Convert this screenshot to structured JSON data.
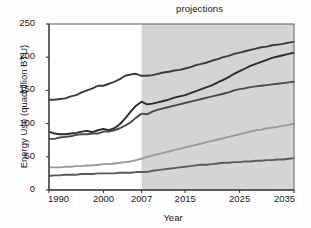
{
  "chart_data": {
    "type": "line",
    "title": "projections",
    "xlabel": "Year",
    "ylabel": "Energy Use (quadrillion BTU)",
    "xlim": [
      1990,
      2035
    ],
    "ylim": [
      0,
      250
    ],
    "xticks": [
      "1990",
      "2000",
      "2007",
      "2015",
      "2025",
      "2035"
    ],
    "xtick_values": [
      1990,
      2000,
      2007,
      2015,
      2025,
      2035
    ],
    "yticks": [
      "0",
      "50",
      "100",
      "150",
      "200",
      "250"
    ],
    "ytick_values": [
      0,
      50,
      100,
      150,
      200,
      250
    ],
    "grid": false,
    "legend_position": "inline-right",
    "annotations": [
      {
        "text": "projections",
        "note": "label above shaded forecast region beginning at 2007"
      }
    ],
    "shaded_region": {
      "from": 2007,
      "to": 2035,
      "label": "projections",
      "color": "#cccccc"
    },
    "x": [
      1990,
      1991,
      1992,
      1993,
      1994,
      1995,
      1996,
      1997,
      1998,
      1999,
      2000,
      2001,
      2002,
      2003,
      2004,
      2005,
      2006,
      2007,
      2008,
      2009,
      2010,
      2011,
      2012,
      2013,
      2014,
      2015,
      2016,
      2017,
      2018,
      2019,
      2020,
      2021,
      2022,
      2023,
      2024,
      2025,
      2026,
      2027,
      2028,
      2029,
      2030,
      2031,
      2032,
      2033,
      2034,
      2035
    ],
    "series": [
      {
        "name": "liquids",
        "color": "#3a3a3a",
        "values": [
          136,
          136,
          137,
          138,
          141,
          143,
          147,
          150,
          153,
          157,
          157,
          160,
          163,
          167,
          172,
          174,
          175,
          172,
          172,
          173,
          175,
          177,
          178,
          180,
          181,
          183,
          185,
          188,
          190,
          192,
          195,
          197,
          200,
          202,
          205,
          207,
          209,
          211,
          213,
          215,
          216,
          218,
          219,
          220,
          222,
          223
        ]
      },
      {
        "name": "coal",
        "color": "#2a2a2a",
        "values": [
          88,
          85,
          84,
          84,
          85,
          86,
          88,
          89,
          87,
          90,
          92,
          90,
          93,
          99,
          108,
          118,
          127,
          133,
          129,
          130,
          132,
          134,
          136,
          139,
          141,
          143,
          146,
          149,
          152,
          155,
          158,
          162,
          166,
          170,
          175,
          179,
          183,
          187,
          190,
          193,
          196,
          199,
          201,
          203,
          205,
          207
        ]
      },
      {
        "name": "natural gas",
        "color": "#4a4a4a",
        "values": [
          77,
          77,
          79,
          80,
          81,
          83,
          84,
          84,
          85,
          85,
          88,
          88,
          90,
          93,
          97,
          102,
          109,
          115,
          114,
          118,
          121,
          123,
          125,
          127,
          129,
          131,
          133,
          135,
          137,
          139,
          141,
          143,
          145,
          147,
          150,
          152,
          153,
          155,
          156,
          157,
          158,
          159,
          160,
          161,
          162,
          163
        ]
      },
      {
        "name": "renewables",
        "color": "#9a9a9a",
        "values": [
          34,
          34,
          34,
          35,
          35,
          36,
          36,
          37,
          37,
          38,
          39,
          39,
          40,
          41,
          42,
          43,
          45,
          47,
          50,
          52,
          54,
          56,
          58,
          60,
          62,
          64,
          66,
          68,
          70,
          72,
          74,
          76,
          78,
          80,
          82,
          84,
          86,
          88,
          90,
          91,
          93,
          94,
          95,
          97,
          98,
          100
        ]
      },
      {
        "name": "nuclear",
        "color": "#5a5a5a",
        "values": [
          21,
          22,
          22,
          23,
          23,
          23,
          24,
          24,
          24,
          25,
          25,
          25,
          25,
          26,
          26,
          26,
          27,
          27,
          27,
          29,
          30,
          31,
          32,
          33,
          34,
          35,
          36,
          37,
          38,
          38,
          39,
          40,
          41,
          41,
          42,
          42,
          43,
          43,
          44,
          44,
          45,
          45,
          46,
          46,
          47,
          48
        ]
      }
    ],
    "series_labels": [
      {
        "name": "liquids",
        "text": "liquids",
        "x": 210,
        "y": 41,
        "color": "#2a2a2a"
      },
      {
        "name": "coal",
        "text": "coal",
        "x": 222,
        "y": 68,
        "color": "#2a2a2a"
      },
      {
        "name": "natural-gas",
        "text": "natural gas",
        "x": 208,
        "y": 96,
        "color": "#2a2a2a"
      },
      {
        "name": "renewables",
        "text": "renewables",
        "x": 210,
        "y": 116,
        "color": "#9a9a9a"
      },
      {
        "name": "nuclear",
        "text": "nuclear",
        "x": 235,
        "y": 152,
        "color": "#2a2a2a"
      }
    ],
    "axis_color": "#777777",
    "plot_background": "#ffffff"
  }
}
